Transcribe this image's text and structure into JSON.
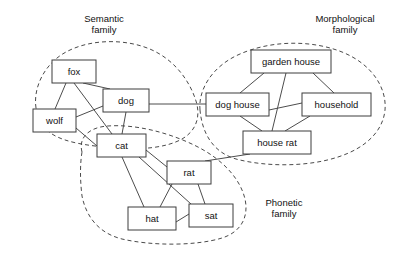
{
  "diagram": {
    "canvas": {
      "width": 413,
      "height": 266
    },
    "style": {
      "background": "#ffffff",
      "node_fill": "#ffffff",
      "node_stroke": "#3d3d3d",
      "edge_stroke": "#4d4d4d",
      "cluster_stroke": "#4a4a4a",
      "text_color": "#111111"
    }
  },
  "clusters": [
    {
      "id": "semantic",
      "label_line1": "Semantic",
      "label_line2": "family",
      "label_x": 104,
      "label_y": 22,
      "members": [
        "fox",
        "wolf",
        "dog",
        "cat"
      ],
      "path": "M 36 108 C 33 88 44 64 66 52 C 92 38 128 39 152 50 C 176 61 190 82 196 101 C 201 117 196 131 182 139 C 166 148 140 150 116 148 C 90 146 66 143 52 134 C 42 128 38 119 36 108 Z"
    },
    {
      "id": "morphological",
      "label_line1": "Morphological",
      "label_line2": "family",
      "label_x": 345,
      "label_y": 22,
      "members": [
        "garden house",
        "dog house",
        "household",
        "house rat"
      ],
      "path": "M 200 110 C 198 90 212 66 240 54 C 272 40 312 40 342 52 C 372 64 387 88 385 110 C 383 131 366 148 338 157 C 308 167 266 167 236 159 C 212 152 202 132 200 110 Z"
    },
    {
      "id": "phonetic",
      "label_line1": "Phonetic",
      "label_line2": "family",
      "label_x": 284,
      "label_y": 206,
      "members": [
        "cat",
        "rat",
        "hat",
        "sat"
      ],
      "path": "M 82 152 C 78 137 90 127 108 126 C 134 124 168 132 196 146 C 222 159 240 178 245 199 C 249 217 241 232 222 238 C 196 246 152 246 122 239 C 98 233 86 216 82 196 C 80 180 80 164 82 152 Z"
    }
  ],
  "nodes": [
    {
      "id": "fox",
      "label": "fox",
      "x": 52,
      "y": 60,
      "w": 44,
      "h": 23
    },
    {
      "id": "wolf",
      "label": "wolf",
      "x": 33,
      "y": 109,
      "w": 43,
      "h": 23
    },
    {
      "id": "dog",
      "label": "dog",
      "x": 103,
      "y": 89,
      "w": 46,
      "h": 23
    },
    {
      "id": "cat",
      "label": "cat",
      "x": 97,
      "y": 134,
      "w": 49,
      "h": 23
    },
    {
      "id": "rat",
      "label": "rat",
      "x": 167,
      "y": 161,
      "w": 44,
      "h": 23
    },
    {
      "id": "hat",
      "label": "hat",
      "x": 128,
      "y": 207,
      "w": 48,
      "h": 23
    },
    {
      "id": "sat",
      "label": "sat",
      "x": 189,
      "y": 204,
      "w": 44,
      "h": 23
    },
    {
      "id": "garden_house",
      "label": "garden house",
      "x": 251,
      "y": 50,
      "w": 80,
      "h": 23
    },
    {
      "id": "dog_house",
      "label": "dog house",
      "x": 206,
      "y": 93,
      "w": 63,
      "h": 23
    },
    {
      "id": "household",
      "label": "household",
      "x": 302,
      "y": 93,
      "w": 69,
      "h": 23
    },
    {
      "id": "house_rat",
      "label": "house rat",
      "x": 243,
      "y": 131,
      "w": 68,
      "h": 23
    }
  ],
  "edges": [
    {
      "from": "fox",
      "to": "wolf",
      "x1": 66,
      "y1": 83,
      "x2": 55,
      "y2": 109
    },
    {
      "from": "fox",
      "to": "dog",
      "x1": 83,
      "y1": 83,
      "x2": 110,
      "y2": 89
    },
    {
      "from": "fox",
      "to": "cat",
      "x1": 74,
      "y1": 83,
      "x2": 112,
      "y2": 134
    },
    {
      "from": "wolf",
      "to": "dog",
      "x1": 76,
      "y1": 117,
      "x2": 103,
      "y2": 106
    },
    {
      "from": "wolf",
      "to": "cat",
      "x1": 76,
      "y1": 128,
      "x2": 97,
      "y2": 146
    },
    {
      "from": "dog",
      "to": "cat",
      "x1": 126,
      "y1": 112,
      "x2": 122,
      "y2": 134
    },
    {
      "from": "dog",
      "to": "dog_house",
      "x1": 149,
      "y1": 104,
      "x2": 206,
      "y2": 104
    },
    {
      "from": "cat",
      "to": "rat",
      "x1": 146,
      "y1": 150,
      "x2": 167,
      "y2": 167
    },
    {
      "from": "cat",
      "to": "hat",
      "x1": 122,
      "y1": 157,
      "x2": 144,
      "y2": 207
    },
    {
      "from": "cat",
      "to": "sat",
      "x1": 139,
      "y1": 157,
      "x2": 191,
      "y2": 204
    },
    {
      "from": "rat",
      "to": "hat",
      "x1": 172,
      "y1": 184,
      "x2": 160,
      "y2": 207
    },
    {
      "from": "rat",
      "to": "sat",
      "x1": 198,
      "y1": 184,
      "x2": 205,
      "y2": 204
    },
    {
      "from": "hat",
      "to": "sat",
      "x1": 176,
      "y1": 222,
      "x2": 189,
      "y2": 214
    },
    {
      "from": "rat",
      "to": "house_rat",
      "x1": 205,
      "y1": 161,
      "x2": 250,
      "y2": 154
    },
    {
      "from": "garden_house",
      "to": "dog_house",
      "x1": 264,
      "y1": 73,
      "x2": 240,
      "y2": 93
    },
    {
      "from": "garden_house",
      "to": "household",
      "x1": 313,
      "y1": 73,
      "x2": 334,
      "y2": 93
    },
    {
      "from": "garden_house",
      "to": "house_rat",
      "x1": 286,
      "y1": 73,
      "x2": 272,
      "y2": 131
    },
    {
      "from": "dog_house",
      "to": "household",
      "x1": 269,
      "y1": 110,
      "x2": 302,
      "y2": 103
    },
    {
      "from": "dog_house",
      "to": "house_rat",
      "x1": 240,
      "y1": 116,
      "x2": 262,
      "y2": 131
    },
    {
      "from": "household",
      "to": "house_rat",
      "x1": 310,
      "y1": 116,
      "x2": 285,
      "y2": 131
    }
  ]
}
